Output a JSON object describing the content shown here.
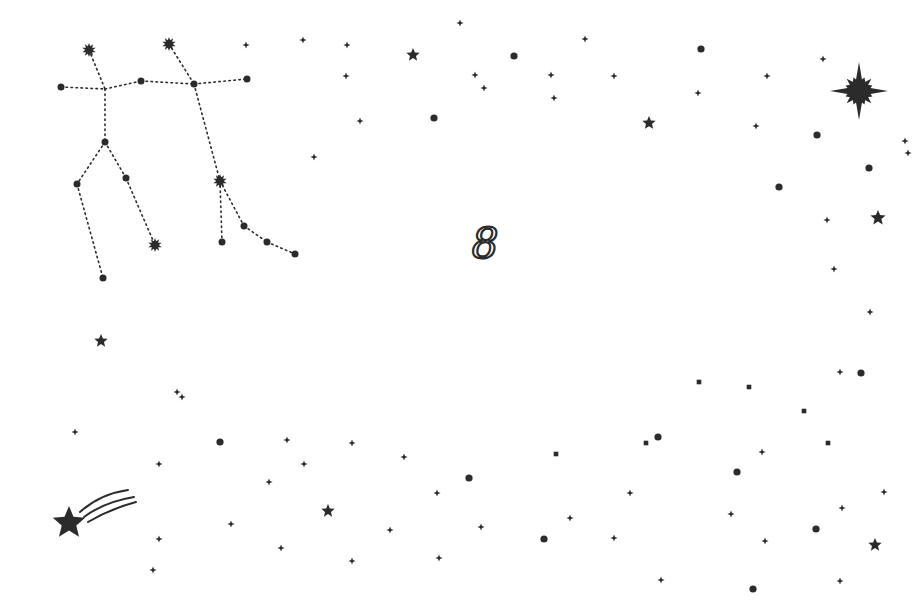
{
  "canvas": {
    "width": 919,
    "height": 609,
    "background": "#ffffff",
    "ink": "#2b2b2b"
  },
  "constellation": {
    "name": "gemini",
    "stars": [
      {
        "x": 89,
        "y": 50,
        "type": "burst",
        "r": 7
      },
      {
        "x": 169,
        "y": 44,
        "type": "burst",
        "r": 7
      },
      {
        "x": 61,
        "y": 87,
        "type": "dot",
        "r": 3.5
      },
      {
        "x": 141,
        "y": 81,
        "type": "dot",
        "r": 3.5
      },
      {
        "x": 194,
        "y": 84,
        "type": "dot",
        "r": 3.5
      },
      {
        "x": 247,
        "y": 79,
        "type": "dot",
        "r": 3.5
      },
      {
        "x": 105,
        "y": 142,
        "type": "dot",
        "r": 3.5
      },
      {
        "x": 77,
        "y": 184,
        "type": "dot",
        "r": 3.5
      },
      {
        "x": 126,
        "y": 178,
        "type": "dot",
        "r": 3.5
      },
      {
        "x": 103,
        "y": 278,
        "type": "dot",
        "r": 3.5
      },
      {
        "x": 155,
        "y": 245,
        "type": "burst",
        "r": 7
      },
      {
        "x": 220,
        "y": 181,
        "type": "burst",
        "r": 7
      },
      {
        "x": 222,
        "y": 242,
        "type": "dot",
        "r": 3.5
      },
      {
        "x": 244,
        "y": 226,
        "type": "dot",
        "r": 3.5
      },
      {
        "x": 267,
        "y": 242,
        "type": "dot",
        "r": 3.5
      },
      {
        "x": 295,
        "y": 254,
        "type": "dot",
        "r": 3.5
      }
    ],
    "lines": [
      [
        61,
        87,
        105,
        89
      ],
      [
        105,
        89,
        141,
        81
      ],
      [
        141,
        81,
        194,
        84
      ],
      [
        194,
        84,
        247,
        79
      ],
      [
        89,
        50,
        105,
        89
      ],
      [
        105,
        89,
        105,
        142
      ],
      [
        105,
        142,
        77,
        184
      ],
      [
        77,
        184,
        103,
        278
      ],
      [
        105,
        142,
        126,
        178
      ],
      [
        126,
        178,
        155,
        245
      ],
      [
        169,
        44,
        194,
        84
      ],
      [
        194,
        84,
        220,
        181
      ],
      [
        220,
        181,
        222,
        242
      ],
      [
        220,
        181,
        244,
        226
      ],
      [
        244,
        226,
        267,
        242
      ],
      [
        267,
        242,
        295,
        254
      ]
    ]
  },
  "zodiac_symbol": {
    "glyph": "8",
    "x": 485,
    "y": 243
  },
  "big_star": {
    "x": 859,
    "y": 91,
    "r": 29
  },
  "shooting_star": {
    "x": 69,
    "y": 523,
    "r": 17
  },
  "stars5": [
    {
      "x": 413,
      "y": 55,
      "r": 7
    },
    {
      "x": 649,
      "y": 123,
      "r": 7
    },
    {
      "x": 878,
      "y": 218,
      "r": 8
    },
    {
      "x": 101,
      "y": 341,
      "r": 7
    },
    {
      "x": 328,
      "y": 511,
      "r": 7
    },
    {
      "x": 875,
      "y": 545,
      "r": 7
    }
  ],
  "dots": [
    [
      514,
      56
    ],
    [
      701,
      49
    ],
    [
      434,
      118
    ],
    [
      817,
      135
    ],
    [
      869,
      168
    ],
    [
      779,
      187
    ],
    [
      220,
      442
    ],
    [
      469,
      478
    ],
    [
      658,
      437
    ],
    [
      861,
      373
    ],
    [
      737,
      472
    ],
    [
      544,
      539
    ],
    [
      816,
      529
    ],
    [
      753,
      589
    ]
  ],
  "sparkles": [
    [
      246,
      45
    ],
    [
      303,
      40
    ],
    [
      347,
      45
    ],
    [
      460,
      23
    ],
    [
      585,
      39
    ],
    [
      346,
      76
    ],
    [
      475,
      75
    ],
    [
      484,
      88
    ],
    [
      551,
      75
    ],
    [
      554,
      98
    ],
    [
      614,
      76
    ],
    [
      698,
      93
    ],
    [
      767,
      76
    ],
    [
      823,
      59
    ],
    [
      756,
      126
    ],
    [
      360,
      121
    ],
    [
      314,
      157
    ],
    [
      905,
      141
    ],
    [
      908,
      153
    ],
    [
      827,
      220
    ],
    [
      834,
      269
    ],
    [
      870,
      312
    ],
    [
      840,
      372
    ],
    [
      177,
      392
    ],
    [
      182,
      397
    ],
    [
      75,
      432
    ],
    [
      159,
      464
    ],
    [
      287,
      440
    ],
    [
      352,
      443
    ],
    [
      304,
      464
    ],
    [
      404,
      457
    ],
    [
      269,
      482
    ],
    [
      437,
      493
    ],
    [
      231,
      524
    ],
    [
      390,
      530
    ],
    [
      481,
      527
    ],
    [
      281,
      548
    ],
    [
      352,
      561
    ],
    [
      439,
      558
    ],
    [
      153,
      570
    ],
    [
      159,
      539
    ],
    [
      570,
      518
    ],
    [
      630,
      493
    ],
    [
      762,
      452
    ],
    [
      884,
      492
    ],
    [
      731,
      514
    ],
    [
      765,
      541
    ],
    [
      842,
      508
    ],
    [
      614,
      538
    ],
    [
      661,
      580
    ],
    [
      840,
      581
    ]
  ],
  "squares": [
    [
      699,
      382
    ],
    [
      749,
      387
    ],
    [
      804,
      411
    ],
    [
      646,
      443
    ],
    [
      828,
      443
    ],
    [
      556,
      454
    ]
  ]
}
